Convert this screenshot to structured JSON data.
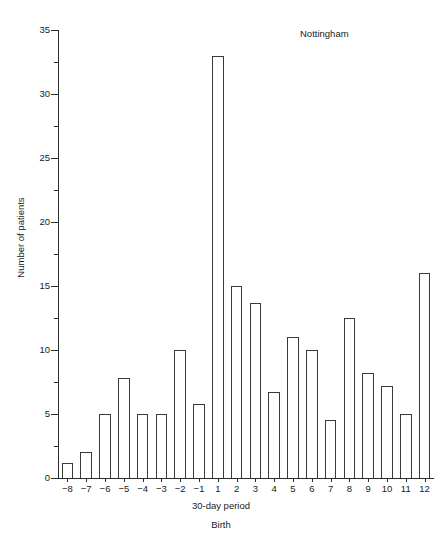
{
  "chart_data": {
    "type": "bar",
    "title": "",
    "annotations": [
      {
        "text": "Nottingham",
        "position": "top-right"
      },
      {
        "text": "Birth",
        "position": "below-x-axis-title"
      }
    ],
    "xlabel": "30-day period",
    "ylabel": "Number of patients",
    "ylim": [
      0,
      35
    ],
    "y_major_ticks": [
      0,
      5,
      10,
      15,
      20,
      25,
      30,
      35
    ],
    "y_tick_labels": [
      "0",
      "5",
      "10",
      "15",
      "20",
      "25",
      "30",
      "35"
    ],
    "y_minor_tick_interval": 2.5,
    "grid": false,
    "legend": null,
    "categories": [
      "-8",
      "-7",
      "-6",
      "-5",
      "-4",
      "-3",
      "-2",
      "-1",
      "1",
      "2",
      "3",
      "4",
      "5",
      "6",
      "7",
      "8",
      "9",
      "10",
      "11",
      "12"
    ],
    "values": [
      1.2,
      2.0,
      5.0,
      7.8,
      5.0,
      5.0,
      10.0,
      5.8,
      33.0,
      15.0,
      13.7,
      6.7,
      11.0,
      10.0,
      4.5,
      12.5,
      8.2,
      7.2,
      5.0,
      16.0
    ]
  },
  "axis": {
    "x_title": "30-day period",
    "birth_marker": "Birth",
    "y_title": "Number of patients"
  },
  "panel": {
    "label": "Nottingham"
  }
}
